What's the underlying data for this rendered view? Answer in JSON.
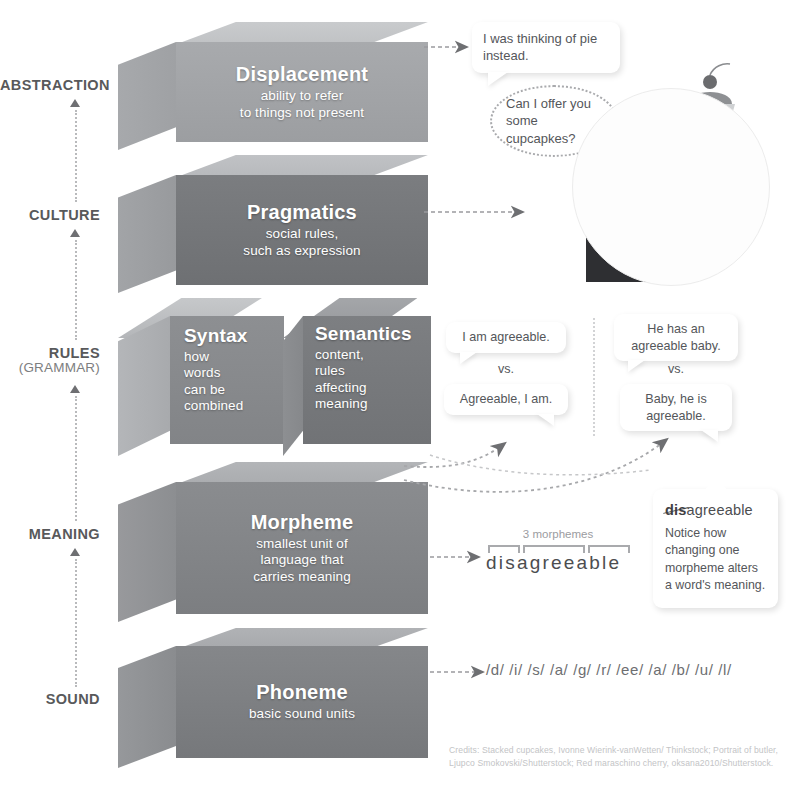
{
  "axis": {
    "levels": [
      {
        "label": "ABSTRACTION",
        "sub": ""
      },
      {
        "label": "CULTURE",
        "sub": ""
      },
      {
        "label": "RULES",
        "sub": "(GRAMMAR)"
      },
      {
        "label": "MEANING",
        "sub": ""
      },
      {
        "label": "SOUND",
        "sub": ""
      }
    ]
  },
  "blocks": [
    {
      "id": "displacement",
      "title": "Displacement",
      "desc": "ability to refer\nto things not present",
      "front_color": "#a3a5a8",
      "top_color": "#c3c5c7",
      "side_color": "#b0b2b5"
    },
    {
      "id": "pragmatics",
      "title": "Pragmatics",
      "desc": "social rules,\nsuch as expression",
      "front_color": "#76787b",
      "top_color": "#b5b7ba",
      "side_color": "#a0a2a5"
    },
    {
      "id": "syntax",
      "title": "Syntax",
      "desc": "how\nwords\ncan be\ncombined",
      "front_color": "#88898c",
      "top_color": "#c0c2c4",
      "side_color": "#b2b4b6"
    },
    {
      "id": "semantics",
      "title": "Semantics",
      "desc": "content,\nrules\naffecting\nmeaning",
      "front_color": "#77797c",
      "top_color": "#9a9c9f",
      "side_color": "#86888b"
    },
    {
      "id": "morpheme",
      "title": "Morpheme",
      "desc": "smallest unit of\nlanguage that\ncarries meaning",
      "front_color": "#83858８",
      "top_color": "#a8aaad",
      "side_color": "#909295"
    },
    {
      "id": "phoneme",
      "title": "Phoneme",
      "desc": "basic sound units",
      "front_color": "#7e8083",
      "top_color": "#a5a7aa",
      "side_color": "#8e9093"
    }
  ],
  "bubbles": {
    "pie": "I was thinking of pie instead.",
    "butler": "Can I offer you some cupcapkes?",
    "syntax_left_top": "I am agreeable.",
    "syntax_left_bottom": "Agreeable, I am.",
    "syntax_right_top": "He has an agreeable baby.",
    "syntax_right_bottom": "Baby, he is agreeable.",
    "vs_left": "vs.",
    "vs_right": "vs."
  },
  "morpheme_example": {
    "caption": "3 morphemes",
    "word": "disagreeable",
    "segments": [
      "dis",
      "agree",
      "able"
    ]
  },
  "callout": {
    "struck": "dis",
    "rest": "agreeable",
    "body": "Notice how changing one morpheme alters a word's meaning."
  },
  "phonemes": "/d/ /i/ /s/ /a/ /g/ /r/ /ee/ /a/ /b/ /u/ /l/",
  "credits": "Credits: Stacked cupcakes, Ivonne Wierink-vanWetten/ Thinkstock; Portrait of butler, Ljupco Smokovski/Shutterstock; Red maraschino cherry, oksana2010/Shutterstock."
}
